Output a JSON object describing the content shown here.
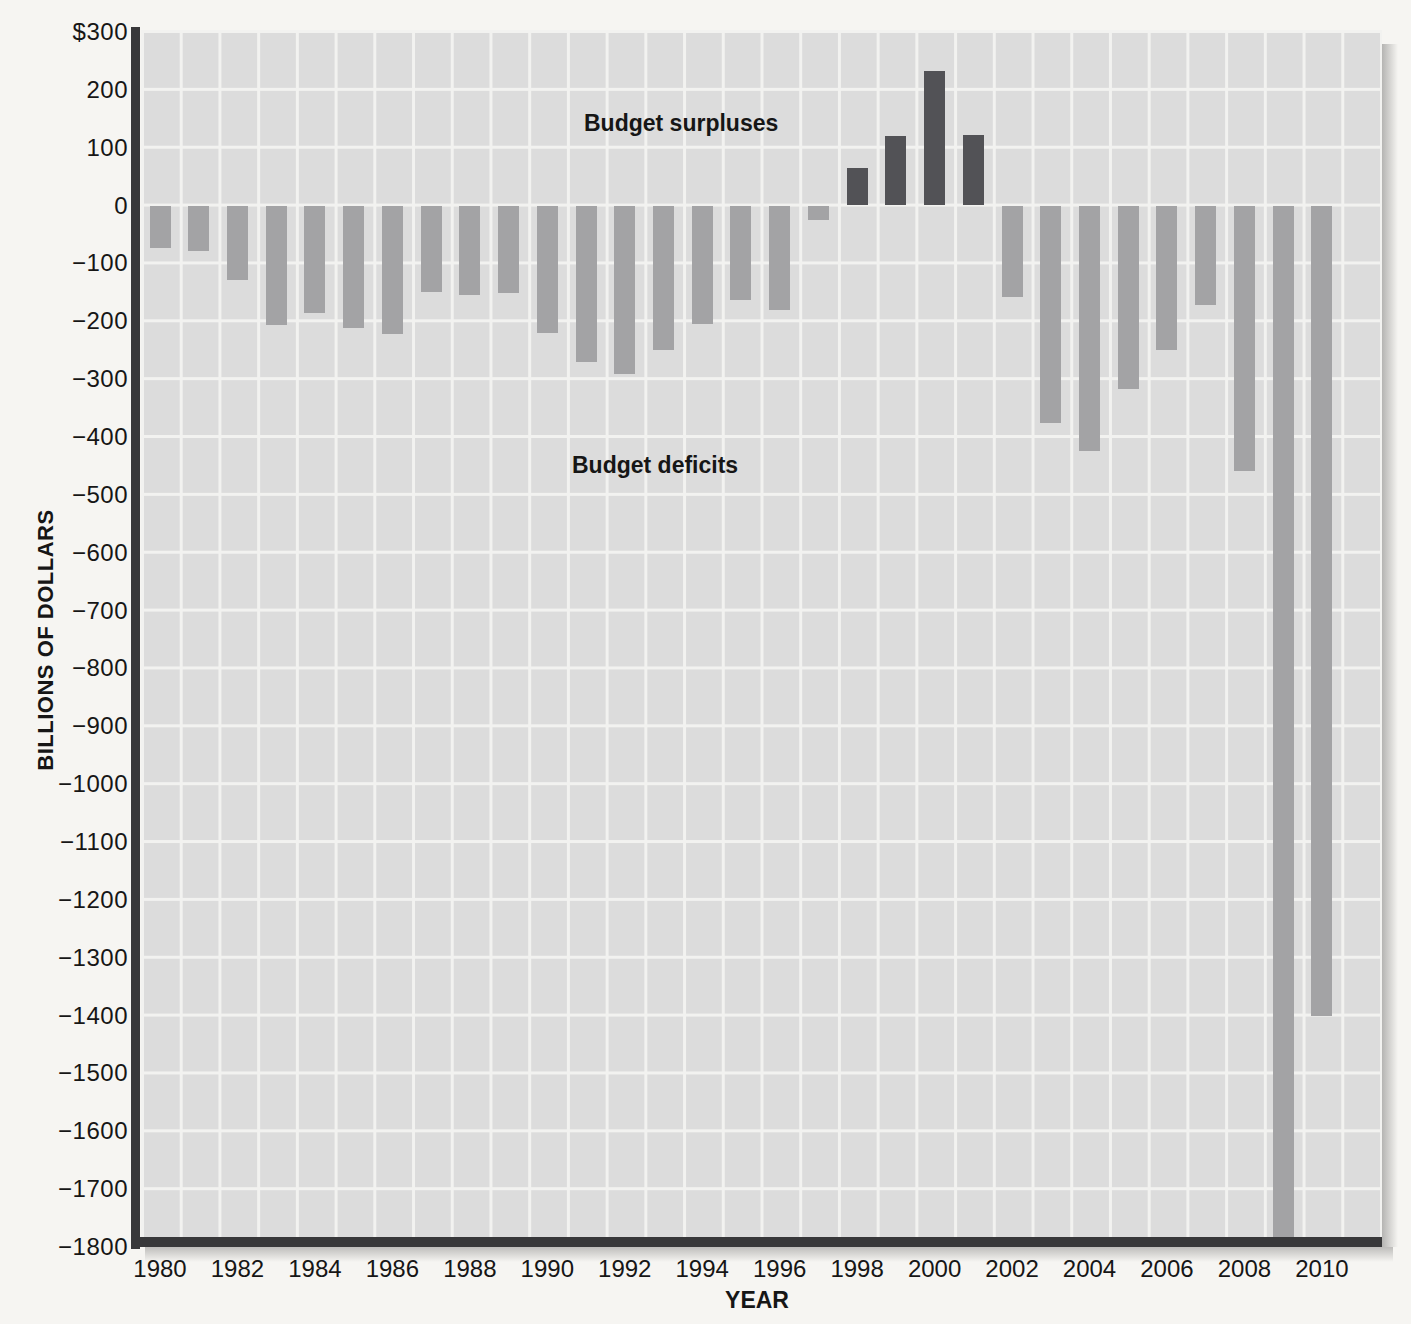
{
  "figure": {
    "y_axis_title": "BILLIONS OF DOLLARS",
    "x_axis_title": "YEAR",
    "surplus_annotation": "Budget surpluses",
    "deficit_annotation": "Budget deficits"
  },
  "chart_data": {
    "type": "bar",
    "title": "",
    "xlabel": "YEAR",
    "ylabel": "BILLIONS OF DOLLARS",
    "ylim": [
      -1800,
      300
    ],
    "y_tick_interval": 100,
    "grid": true,
    "legend": "none",
    "y_tick_labels": [
      "$300",
      "200",
      "100",
      "0",
      "−100",
      "−200",
      "−300",
      "−400",
      "−500",
      "−600",
      "−700",
      "−800",
      "−900",
      "−1000",
      "−1100",
      "−1200",
      "−1300",
      "−1400",
      "−1500",
      "−1600",
      "−1700",
      "−1800"
    ],
    "x_tick_labels": [
      "1980",
      "1982",
      "1984",
      "1986",
      "1988",
      "1990",
      "1992",
      "1994",
      "1996",
      "1998",
      "2000",
      "2002",
      "2004",
      "2006",
      "2008",
      "2010"
    ],
    "years": [
      1980,
      1981,
      1982,
      1983,
      1984,
      1985,
      1986,
      1987,
      1988,
      1989,
      1990,
      1991,
      1992,
      1993,
      1994,
      1995,
      1996,
      1997,
      1998,
      1999,
      2000,
      2001,
      2002,
      2003,
      2004,
      2005,
      2006,
      2007,
      2008,
      2009,
      2010
    ],
    "values": [
      -74,
      -79,
      -128,
      -207,
      -185,
      -212,
      -222,
      -150,
      -155,
      -152,
      -221,
      -270,
      -292,
      -250,
      -204,
      -164,
      -180,
      -25,
      65,
      120,
      232,
      122,
      -158,
      -376,
      -424,
      -318,
      -249,
      -172,
      -459,
      -1850,
      -1400
    ],
    "clipped_bars": {
      "2009": "bar extends below the −1800 chart bottom (drawn clipped at axis)"
    },
    "series_colors": {
      "deficit": "#a3a3a5",
      "surplus": "#525256"
    },
    "plot_background": "#dcdcdc",
    "gridline_color": "#f2f2f0",
    "axis_color": "#38383a"
  }
}
